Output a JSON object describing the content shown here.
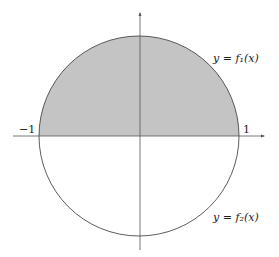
{
  "diagram": {
    "type": "unit-circle-region",
    "shaded_region": "upper half of unit circle",
    "colors": {
      "shade": "#c4c4c4",
      "stroke": "#333333",
      "axis": "#555555",
      "background": "#ffffff"
    },
    "labels": {
      "upper_curve": "y = f₁(x)",
      "lower_curve": "y = f₂(x)",
      "x_left": "−1",
      "x_right": "1"
    }
  }
}
